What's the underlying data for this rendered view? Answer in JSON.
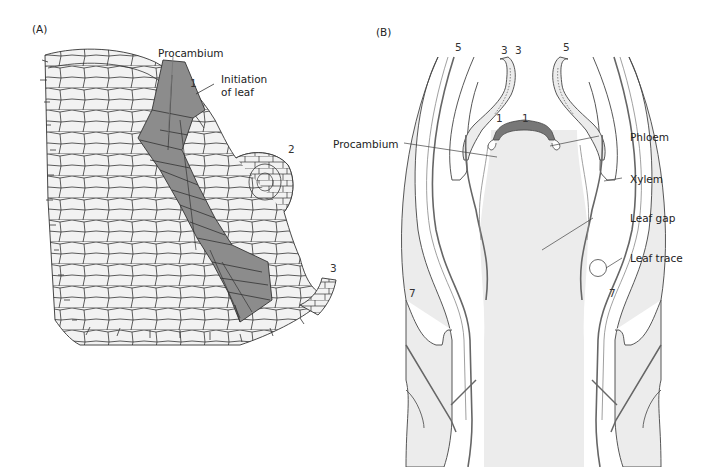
{
  "figure": {
    "panel_a": {
      "panel_label": "(A)",
      "labels": {
        "procambium": "Procambium",
        "initiation_line1": "Initiation",
        "initiation_line2": "of leaf"
      },
      "leaf_numbers": [
        "1",
        "2",
        "3"
      ],
      "colors": {
        "cell_fill": "#f2f2f2",
        "procambium_fill": "#8c8c8c",
        "cell_outline": "#333333"
      }
    },
    "panel_b": {
      "panel_label": "(B)",
      "labels": {
        "procambium": "Procambium",
        "phloem": "Phloem",
        "xylem": "Xylem",
        "leaf_gap": "Leaf gap",
        "leaf_trace": "Leaf trace"
      },
      "leaf_numbers": {
        "top_left": "5",
        "top_right": "5",
        "tip_left": "3",
        "tip_right": "3",
        "inner_left": "1",
        "inner_right": "1",
        "lower_left": "7",
        "lower_right": "7"
      },
      "colors": {
        "tissue_fill": "#ececec",
        "strand": "#666666",
        "outline": "#444444",
        "apex_cap": "#777777"
      }
    }
  }
}
